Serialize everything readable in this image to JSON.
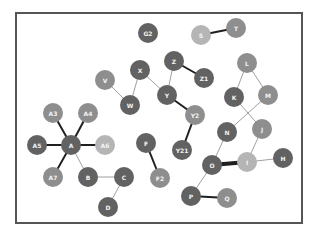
{
  "diagram": {
    "type": "graph",
    "frame": {
      "x": 15,
      "y": 12,
      "width": 288,
      "height": 212,
      "border_color": "#555555"
    },
    "node_radius": 10,
    "palette": {
      "dark": "#626262",
      "medium": "#8e8e8e",
      "light": "#b5b5b5",
      "label": "#f4f4f4",
      "edge": "#333333"
    },
    "nodes": [
      {
        "id": "G2",
        "label": "G2",
        "x": 148,
        "y": 33,
        "shade": "dark"
      },
      {
        "id": "S",
        "label": "S",
        "x": 201,
        "y": 35,
        "shade": "light"
      },
      {
        "id": "T",
        "label": "T",
        "x": 236,
        "y": 28,
        "shade": "medium"
      },
      {
        "id": "Z",
        "label": "Z",
        "x": 174,
        "y": 61,
        "shade": "dark"
      },
      {
        "id": "Z1",
        "label": "Z1",
        "x": 204,
        "y": 78,
        "shade": "dark"
      },
      {
        "id": "X",
        "label": "X",
        "x": 140,
        "y": 70,
        "shade": "dark"
      },
      {
        "id": "V",
        "label": "V",
        "x": 105,
        "y": 80,
        "shade": "medium"
      },
      {
        "id": "W",
        "label": "W",
        "x": 130,
        "y": 105,
        "shade": "dark"
      },
      {
        "id": "Y",
        "label": "Y",
        "x": 167,
        "y": 95,
        "shade": "dark"
      },
      {
        "id": "Y2",
        "label": "Y2",
        "x": 195,
        "y": 115,
        "shade": "medium"
      },
      {
        "id": "Y21",
        "label": "Y21",
        "x": 182,
        "y": 150,
        "shade": "dark"
      },
      {
        "id": "L",
        "label": "L",
        "x": 247,
        "y": 63,
        "shade": "medium"
      },
      {
        "id": "K",
        "label": "K",
        "x": 234,
        "y": 97,
        "shade": "dark"
      },
      {
        "id": "M",
        "label": "M",
        "x": 268,
        "y": 95,
        "shade": "medium"
      },
      {
        "id": "N",
        "label": "N",
        "x": 227,
        "y": 132,
        "shade": "dark"
      },
      {
        "id": "J",
        "label": "J",
        "x": 262,
        "y": 129,
        "shade": "medium"
      },
      {
        "id": "O",
        "label": "O",
        "x": 212,
        "y": 165,
        "shade": "dark"
      },
      {
        "id": "I",
        "label": "I",
        "x": 247,
        "y": 162,
        "shade": "light"
      },
      {
        "id": "H",
        "label": "H",
        "x": 283,
        "y": 158,
        "shade": "dark"
      },
      {
        "id": "P",
        "label": "P",
        "x": 191,
        "y": 196,
        "shade": "dark"
      },
      {
        "id": "Q",
        "label": "Q",
        "x": 227,
        "y": 198,
        "shade": "medium"
      },
      {
        "id": "A3",
        "label": "A3",
        "x": 53,
        "y": 113,
        "shade": "medium"
      },
      {
        "id": "A4",
        "label": "A4",
        "x": 88,
        "y": 113,
        "shade": "medium"
      },
      {
        "id": "A5",
        "label": "A5",
        "x": 37,
        "y": 145,
        "shade": "dark"
      },
      {
        "id": "A",
        "label": "A",
        "x": 71,
        "y": 145,
        "shade": "dark"
      },
      {
        "id": "A6",
        "label": "A6",
        "x": 105,
        "y": 145,
        "shade": "light"
      },
      {
        "id": "A7",
        "label": "A7",
        "x": 53,
        "y": 177,
        "shade": "medium"
      },
      {
        "id": "B",
        "label": "B",
        "x": 88,
        "y": 177,
        "shade": "dark"
      },
      {
        "id": "C",
        "label": "C",
        "x": 124,
        "y": 177,
        "shade": "dark"
      },
      {
        "id": "D",
        "label": "D",
        "x": 108,
        "y": 207,
        "shade": "dark"
      },
      {
        "id": "F",
        "label": "F",
        "x": 146,
        "y": 143,
        "shade": "dark"
      },
      {
        "id": "F2",
        "label": "F2",
        "x": 160,
        "y": 178,
        "shade": "medium"
      }
    ],
    "edges": [
      {
        "from": "S",
        "to": "T",
        "weight": 2
      },
      {
        "from": "Z",
        "to": "Z1",
        "weight": 2
      },
      {
        "from": "Z",
        "to": "Y",
        "weight": 0.7
      },
      {
        "from": "X",
        "to": "W",
        "weight": 0.7
      },
      {
        "from": "X",
        "to": "Y",
        "weight": 0.7
      },
      {
        "from": "V",
        "to": "W",
        "weight": 0.7
      },
      {
        "from": "Y",
        "to": "Y2",
        "weight": 2
      },
      {
        "from": "Y2",
        "to": "Y21",
        "weight": 2
      },
      {
        "from": "L",
        "to": "K",
        "weight": 0.7
      },
      {
        "from": "L",
        "to": "M",
        "weight": 0.7
      },
      {
        "from": "K",
        "to": "J",
        "weight": 0.7
      },
      {
        "from": "M",
        "to": "N",
        "weight": 0.7
      },
      {
        "from": "N",
        "to": "O",
        "weight": 0.7
      },
      {
        "from": "J",
        "to": "I",
        "weight": 0.7
      },
      {
        "from": "O",
        "to": "I",
        "weight": 4
      },
      {
        "from": "I",
        "to": "H",
        "weight": 0.7
      },
      {
        "from": "O",
        "to": "P",
        "weight": 0.7
      },
      {
        "from": "P",
        "to": "Q",
        "weight": 2
      },
      {
        "from": "A",
        "to": "A3",
        "weight": 2
      },
      {
        "from": "A",
        "to": "A4",
        "weight": 2
      },
      {
        "from": "A",
        "to": "A5",
        "weight": 2
      },
      {
        "from": "A",
        "to": "A6",
        "weight": 2
      },
      {
        "from": "A",
        "to": "A7",
        "weight": 2
      },
      {
        "from": "A",
        "to": "B",
        "weight": 0.7
      },
      {
        "from": "B",
        "to": "C",
        "weight": 0.7
      },
      {
        "from": "C",
        "to": "D",
        "weight": 0.7
      },
      {
        "from": "F",
        "to": "F2",
        "weight": 2
      }
    ]
  }
}
